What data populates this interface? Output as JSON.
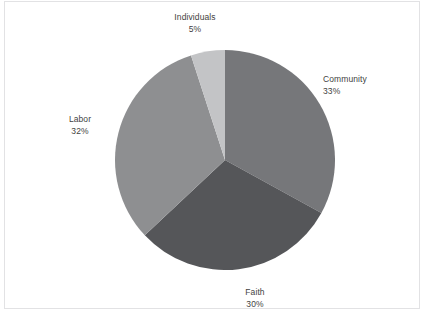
{
  "chart_data": {
    "type": "pie",
    "title": "",
    "categories": [
      "Community",
      "Faith",
      "Labor",
      "Individuals"
    ],
    "values": [
      33,
      30,
      32,
      5
    ],
    "value_unit": "%",
    "legend": "none",
    "grid": false,
    "start_angle_deg": 0,
    "direction": "clockwise",
    "slices": [
      {
        "name": "Community",
        "value": 33,
        "label_value": "33%",
        "color": "#76777a",
        "start_deg": 0,
        "end_deg": 118.8
      },
      {
        "name": "Faith",
        "value": 30,
        "label_value": "30%",
        "color": "#555659",
        "start_deg": 118.8,
        "end_deg": 226.8
      },
      {
        "name": "Labor",
        "value": 32,
        "label_value": "32%",
        "color": "#8e8f91",
        "start_deg": 226.8,
        "end_deg": 342.0
      },
      {
        "name": "Individuals",
        "value": 5,
        "label_value": "5%",
        "color": "#c3c4c6",
        "start_deg": 342.0,
        "end_deg": 360.0
      }
    ]
  },
  "labels": {
    "individuals": {
      "name": "Individuals",
      "value": "5%"
    },
    "community": {
      "name": "Community",
      "value": "33%"
    },
    "labor": {
      "name": "Labor",
      "value": "32%"
    },
    "faith": {
      "name": "Faith",
      "value": "30%"
    }
  },
  "colors": {
    "community": "#76777a",
    "faith": "#555659",
    "labor": "#8e8f91",
    "individuals": "#c3c4c6",
    "label_text": "#3f3f41",
    "frame_border": "#e2e2e4",
    "background": "#ffffff"
  }
}
